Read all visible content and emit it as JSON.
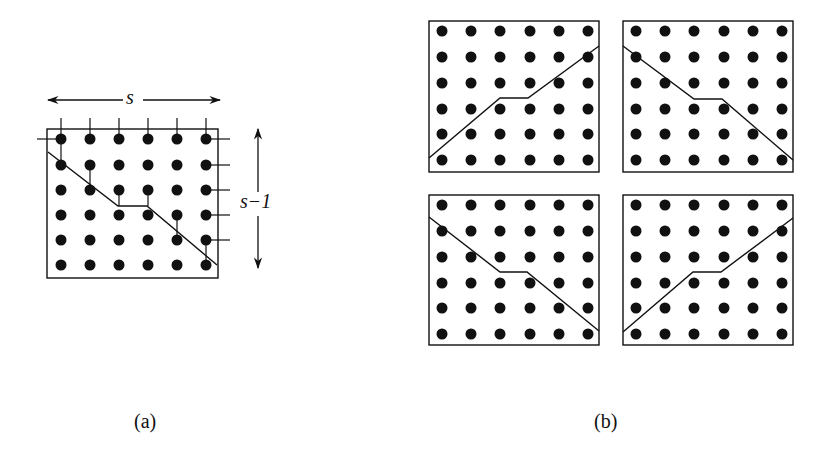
{
  "figure": {
    "panel_a": {
      "caption": "(a)",
      "width_label": "s",
      "height_label": "s−1",
      "grid": {
        "cols": 6,
        "rows": 6
      },
      "box": {
        "x": 47,
        "y": 129,
        "w": 171,
        "h": 149
      },
      "dot_x": [
        61,
        90,
        119,
        148,
        177,
        206
      ],
      "dot_y": [
        139,
        165,
        190,
        215,
        240,
        265
      ],
      "cut_path": [
        [
          48,
          152
        ],
        [
          118,
          206
        ],
        [
          147,
          206
        ],
        [
          217,
          265
        ]
      ]
    },
    "panel_b": {
      "caption": "(b)",
      "boxes": [
        {
          "x": 429,
          "y": 21,
          "w": 170,
          "h": 151,
          "cut_path": [
            [
              429,
              158
            ],
            [
              500,
              98
            ],
            [
              528,
              98
            ],
            [
              599,
              46
            ]
          ]
        },
        {
          "x": 623,
          "y": 21,
          "w": 170,
          "h": 151,
          "cut_path": [
            [
              623,
              46
            ],
            [
              694,
              99
            ],
            [
              722,
              99
            ],
            [
              793,
              160
            ]
          ]
        },
        {
          "x": 429,
          "y": 195,
          "w": 170,
          "h": 150,
          "cut_path": [
            [
              429,
              217
            ],
            [
              500,
              272
            ],
            [
              527,
              272
            ],
            [
              599,
              331
            ]
          ]
        },
        {
          "x": 623,
          "y": 195,
          "w": 170,
          "h": 150,
          "cut_path": [
            [
              623,
              332
            ],
            [
              693,
              272
            ],
            [
              721,
              272
            ],
            [
              793,
              218
            ]
          ]
        }
      ],
      "dot_offset_x": [
        13,
        42,
        71,
        101,
        130,
        159
      ],
      "dot_offset_y": [
        10,
        36,
        62,
        88,
        113,
        139
      ]
    },
    "colors": {
      "ink": "#111111",
      "background": "#ffffff"
    }
  }
}
